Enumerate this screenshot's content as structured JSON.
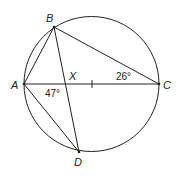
{
  "diagram": {
    "type": "geometry-circle-inscribed",
    "stroke_color": "#222222",
    "background": "#ffffff",
    "circle": {
      "cx": 91.5,
      "cy": 84,
      "r": 67.5
    },
    "points": {
      "A": {
        "label": "A",
        "x": 24,
        "y": 84
      },
      "B": {
        "label": "B",
        "x": 54,
        "y": 27
      },
      "C": {
        "label": "C",
        "x": 159,
        "y": 84
      },
      "D": {
        "label": "D",
        "x": 79,
        "y": 152
      },
      "X": {
        "label": "X",
        "x": 67,
        "y": 84
      }
    },
    "segments": [
      "AB",
      "BC",
      "AC",
      "BD",
      "AD"
    ],
    "tick_mark_on": "AC",
    "angles": {
      "AXD": {
        "label": "47°"
      },
      "BCA": {
        "label": "26°"
      }
    }
  }
}
